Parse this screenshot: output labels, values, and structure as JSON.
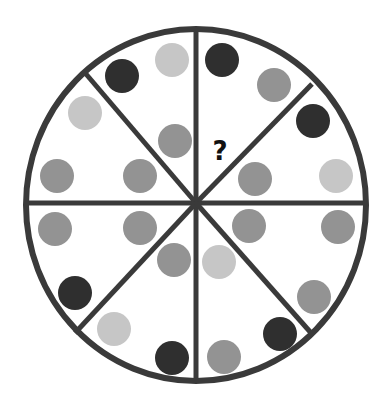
{
  "puzzle": {
    "type": "circle-sector-dot-sequence",
    "question_mark": "?",
    "colors": {
      "outline": "#3a3a3a",
      "background": "#ffffff",
      "dark": "#2f2f2f",
      "medium": "#939393",
      "light": "#c6c6c6"
    },
    "circle": {
      "cx": 196,
      "cy": 205,
      "rx": 170,
      "ry": 176
    },
    "dot_radius": 17,
    "sectors": [
      {
        "name": "top-left",
        "dots": [
          {
            "x": 122,
            "y": 76,
            "shade": "dark"
          },
          {
            "x": 172,
            "y": 60,
            "shade": "light"
          },
          {
            "x": 175,
            "y": 141,
            "shade": "medium"
          }
        ]
      },
      {
        "name": "top-right",
        "dots": [
          {
            "x": 222,
            "y": 60,
            "shade": "dark"
          },
          {
            "x": 274,
            "y": 85,
            "shade": "medium"
          }
        ],
        "question": {
          "x": 220,
          "y": 160
        }
      },
      {
        "name": "right-upper",
        "dots": [
          {
            "x": 313,
            "y": 121,
            "shade": "dark"
          },
          {
            "x": 336,
            "y": 176,
            "shade": "light"
          },
          {
            "x": 255,
            "y": 179,
            "shade": "medium"
          }
        ]
      },
      {
        "name": "right-lower",
        "dots": [
          {
            "x": 249,
            "y": 226,
            "shade": "medium"
          },
          {
            "x": 338,
            "y": 227,
            "shade": "medium"
          },
          {
            "x": 314,
            "y": 297,
            "shade": "medium"
          }
        ]
      },
      {
        "name": "bottom-right",
        "dots": [
          {
            "x": 219,
            "y": 262,
            "shade": "light"
          },
          {
            "x": 280,
            "y": 334,
            "shade": "dark"
          },
          {
            "x": 224,
            "y": 357,
            "shade": "medium"
          }
        ]
      },
      {
        "name": "bottom-left",
        "dots": [
          {
            "x": 174,
            "y": 260,
            "shade": "medium"
          },
          {
            "x": 114,
            "y": 329,
            "shade": "light"
          },
          {
            "x": 172,
            "y": 358,
            "shade": "dark"
          }
        ]
      },
      {
        "name": "left-lower",
        "dots": [
          {
            "x": 55,
            "y": 229,
            "shade": "medium"
          },
          {
            "x": 140,
            "y": 228,
            "shade": "medium"
          },
          {
            "x": 75,
            "y": 293,
            "shade": "dark"
          }
        ]
      },
      {
        "name": "left-upper",
        "dots": [
          {
            "x": 85,
            "y": 113,
            "shade": "light"
          },
          {
            "x": 57,
            "y": 176,
            "shade": "medium"
          },
          {
            "x": 140,
            "y": 176,
            "shade": "medium"
          }
        ]
      }
    ],
    "dividers": [
      {
        "x1": 196,
        "y1": 29,
        "x2": 196,
        "y2": 381
      },
      {
        "x1": 26,
        "y1": 203,
        "x2": 366,
        "y2": 203
      },
      {
        "x1": 86,
        "y1": 74,
        "x2": 196,
        "y2": 203
      },
      {
        "x1": 312,
        "y1": 84,
        "x2": 196,
        "y2": 203
      },
      {
        "x1": 75,
        "y1": 333,
        "x2": 196,
        "y2": 203
      },
      {
        "x1": 312,
        "y1": 334,
        "x2": 196,
        "y2": 203
      }
    ]
  }
}
